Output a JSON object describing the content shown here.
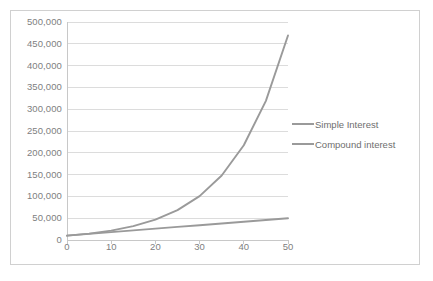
{
  "chart_data": {
    "type": "line",
    "title": "",
    "xlabel": "",
    "ylabel": "",
    "xlim": [
      0,
      50
    ],
    "ylim": [
      0,
      500000
    ],
    "grid": true,
    "grid_axis": "y",
    "legend_position": "right",
    "x_ticks": [
      "0",
      "10",
      "20",
      "30",
      "40",
      "50"
    ],
    "x_tick_values": [
      0,
      10,
      20,
      30,
      40,
      50
    ],
    "y_ticks": [
      "0",
      "50,000",
      "100,000",
      "150,000",
      "200,000",
      "250,000",
      "300,000",
      "350,000",
      "400,000",
      "450,000",
      "500,000"
    ],
    "y_tick_values": [
      0,
      50000,
      100000,
      150000,
      200000,
      250000,
      300000,
      350000,
      400000,
      450000,
      500000
    ],
    "x": [
      0,
      5,
      10,
      15,
      20,
      25,
      30,
      35,
      40,
      45,
      50
    ],
    "series": [
      {
        "name": "Simple Interest",
        "color": "#9a9a9a",
        "values": [
          10000,
          14000,
          18000,
          22000,
          26000,
          30000,
          34000,
          38000,
          42000,
          46000,
          50000
        ]
      },
      {
        "name": "Compound interest",
        "color": "#9a9a9a",
        "values": [
          10000,
          14693,
          21589,
          31722,
          46610,
          68485,
          100627,
          147853,
          217245,
          319204,
          469016
        ]
      }
    ]
  },
  "legend": {
    "items": [
      {
        "label": "Simple Interest"
      },
      {
        "label": "Compound interest"
      }
    ]
  },
  "colors": {
    "series_line": "#9a9a9a",
    "gridline": "#dcdcdc",
    "axis": "#c8c8c8",
    "tick_text": "#808080",
    "frame_border": "#d0d0d0",
    "background": "#ffffff"
  }
}
